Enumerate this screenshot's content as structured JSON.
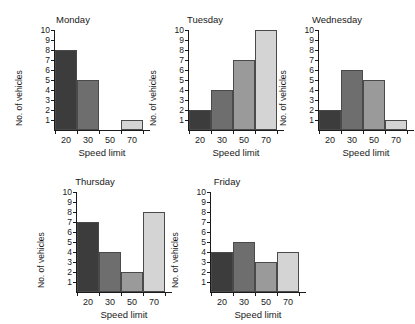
{
  "figure": {
    "axis_color": "#1a1a1a",
    "background": "#ffffff",
    "bar_border_color": "#4a4a4a",
    "bar_colors": [
      "#3c3c3c",
      "#6e6e6e",
      "#9a9a9a",
      "#d4d4d4"
    ]
  },
  "chart_data": [
    {
      "type": "bar",
      "title": "Monday",
      "categories": [
        "20",
        "30",
        "50",
        "70"
      ],
      "values": [
        8,
        5,
        0,
        1
      ],
      "xlabel": "Speed limit",
      "ylabel": "No. of vehicles",
      "ylim": [
        0,
        10
      ],
      "yticks": [
        1,
        2,
        3,
        4,
        5,
        6,
        7,
        8,
        9,
        10
      ],
      "grid": false,
      "legend": "none"
    },
    {
      "type": "bar",
      "title": "Tuesday",
      "categories": [
        "20",
        "30",
        "50",
        "70"
      ],
      "values": [
        2,
        4,
        7,
        10
      ],
      "xlabel": "Speed limit",
      "ylabel": "No. of vehicles",
      "ylim": [
        0,
        10
      ],
      "yticks": [
        1,
        2,
        3,
        4,
        5,
        6,
        7,
        8,
        9,
        10
      ],
      "grid": false,
      "legend": "none"
    },
    {
      "type": "bar",
      "title": "Wednesday",
      "categories": [
        "20",
        "30",
        "50",
        "70"
      ],
      "values": [
        2,
        6,
        5,
        1
      ],
      "xlabel": "Speed limit",
      "ylabel": "No. of vehicles",
      "ylim": [
        0,
        10
      ],
      "yticks": [
        1,
        2,
        3,
        4,
        5,
        6,
        7,
        8,
        9,
        10
      ],
      "grid": false,
      "legend": "none"
    },
    {
      "type": "bar",
      "title": "Thursday",
      "categories": [
        "20",
        "30",
        "50",
        "70"
      ],
      "values": [
        7,
        4,
        2,
        8
      ],
      "xlabel": "Speed limit",
      "ylabel": "No. of vehicles",
      "ylim": [
        0,
        10
      ],
      "yticks": [
        1,
        2,
        3,
        4,
        5,
        6,
        7,
        8,
        9,
        10
      ],
      "grid": false,
      "legend": "none"
    },
    {
      "type": "bar",
      "title": "Friday",
      "categories": [
        "20",
        "30",
        "50",
        "70"
      ],
      "values": [
        4,
        5,
        3,
        4
      ],
      "xlabel": "Speed limit",
      "ylabel": "No. of vehicles",
      "ylim": [
        0,
        10
      ],
      "yticks": [
        1,
        2,
        3,
        4,
        5,
        6,
        7,
        8,
        9,
        10
      ],
      "grid": false,
      "legend": "none"
    }
  ],
  "layout": {
    "panels": [
      {
        "left": 8,
        "top": 14,
        "width": 130,
        "height": 148
      },
      {
        "left": 142,
        "top": 14,
        "width": 126,
        "height": 148
      },
      {
        "left": 272,
        "top": 14,
        "width": 130,
        "height": 148
      },
      {
        "left": 30,
        "top": 176,
        "width": 130,
        "height": 148
      },
      {
        "left": 164,
        "top": 176,
        "width": 126,
        "height": 148
      }
    ]
  }
}
